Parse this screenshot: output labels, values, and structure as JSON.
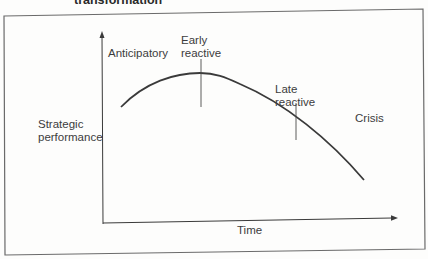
{
  "figure": {
    "title": "transformation",
    "y_axis_label_line1": "Strategic",
    "y_axis_label_line2": "performance",
    "x_axis_label": "Time",
    "phases": {
      "anticipatory": "Anticipatory",
      "early_reactive_line1": "Early",
      "early_reactive_line2": "reactive",
      "late_reactive_line1": "Late",
      "late_reactive_line2": "reactive",
      "crisis": "Crisis"
    },
    "colors": {
      "line": "#3a3a3a",
      "frame": "#6a6a6a",
      "background": "#fdfdfc"
    }
  }
}
